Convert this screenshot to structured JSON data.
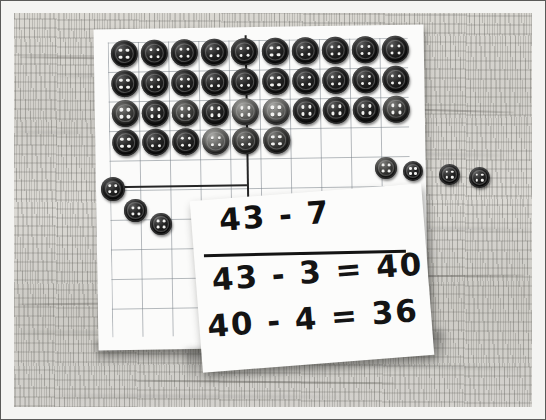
{
  "scene": {
    "title": "Place-value subtraction with buttons on graph paper",
    "medium": "photograph",
    "background": "wooden desk surface",
    "palette": {
      "desk": "#d4d2cc",
      "paper": "#fbfbfa",
      "card": "#fcfcfb",
      "ink": "#141414",
      "grid_line": "#78808833",
      "button_dark": "#0d0d0d",
      "button_hole": "#f2f2f0"
    }
  },
  "handwriting": {
    "problem": "43 - 7",
    "step_1": "43 - 3 = 40",
    "step_2": "40 - 4 = 36"
  },
  "chart_data": {
    "type": "table",
    "xlabel": "grid column",
    "ylabel": "grid row",
    "grid": true,
    "legend": "none",
    "rows": [
      {
        "row": 1,
        "tens_side": 5,
        "ones_side": 5,
        "total": 10
      },
      {
        "row": 2,
        "tens_side": 5,
        "ones_side": 5,
        "total": 10
      },
      {
        "row": 3,
        "tens_side": 5,
        "ones_side": 5,
        "total": 10
      },
      {
        "row": 4,
        "tens_side": 5,
        "ones_side": 1,
        "total": 6
      }
    ],
    "categories": [
      "row 1",
      "row 2",
      "row 3",
      "row 4"
    ],
    "values": [
      10,
      10,
      10,
      6
    ],
    "buttons_remaining_on_grid": 36,
    "buttons_removed_right": 4,
    "buttons_removed_bottom_left": 3,
    "buttons_removed_total": 7,
    "buttons_at_start": 43,
    "annotations": [
      "43 - 7",
      "43 - 3 = 40",
      "40 - 4 = 36"
    ]
  },
  "grid_buttons": [
    {
      "r": 0,
      "c": 0,
      "tone": "dark"
    },
    {
      "r": 0,
      "c": 1,
      "tone": "dark"
    },
    {
      "r": 0,
      "c": 2,
      "tone": "dark"
    },
    {
      "r": 0,
      "c": 3,
      "tone": "dark"
    },
    {
      "r": 0,
      "c": 4,
      "tone": "dark"
    },
    {
      "r": 0,
      "c": 5,
      "tone": "dark"
    },
    {
      "r": 0,
      "c": 6,
      "tone": "dark"
    },
    {
      "r": 0,
      "c": 7,
      "tone": "dark"
    },
    {
      "r": 0,
      "c": 8,
      "tone": "dark"
    },
    {
      "r": 0,
      "c": 9,
      "tone": "dark"
    },
    {
      "r": 1,
      "c": 0,
      "tone": "dark"
    },
    {
      "r": 1,
      "c": 1,
      "tone": "dark"
    },
    {
      "r": 1,
      "c": 2,
      "tone": "dark"
    },
    {
      "r": 1,
      "c": 3,
      "tone": "dark"
    },
    {
      "r": 1,
      "c": 4,
      "tone": "dark"
    },
    {
      "r": 1,
      "c": 5,
      "tone": "dark"
    },
    {
      "r": 1,
      "c": 6,
      "tone": "dark"
    },
    {
      "r": 1,
      "c": 7,
      "tone": "dark"
    },
    {
      "r": 1,
      "c": 8,
      "tone": "dark"
    },
    {
      "r": 1,
      "c": 9,
      "tone": "dark"
    },
    {
      "r": 2,
      "c": 0,
      "tone": "mid"
    },
    {
      "r": 2,
      "c": 1,
      "tone": "dark"
    },
    {
      "r": 2,
      "c": 2,
      "tone": "mid"
    },
    {
      "r": 2,
      "c": 3,
      "tone": "dark"
    },
    {
      "r": 2,
      "c": 4,
      "tone": "light"
    },
    {
      "r": 2,
      "c": 5,
      "tone": "light"
    },
    {
      "r": 2,
      "c": 6,
      "tone": "dark"
    },
    {
      "r": 2,
      "c": 7,
      "tone": "dark"
    },
    {
      "r": 2,
      "c": 8,
      "tone": "dark"
    },
    {
      "r": 2,
      "c": 9,
      "tone": "mid"
    },
    {
      "r": 3,
      "c": 0,
      "tone": "dark"
    },
    {
      "r": 3,
      "c": 1,
      "tone": "dark"
    },
    {
      "r": 3,
      "c": 2,
      "tone": "dark"
    },
    {
      "r": 3,
      "c": 3,
      "tone": "light"
    },
    {
      "r": 3,
      "c": 4,
      "tone": "mid"
    },
    {
      "r": 3,
      "c": 5,
      "tone": "mid"
    }
  ],
  "loose_buttons": [
    {
      "x": 375,
      "y": 157,
      "size": 22,
      "tone": "mid",
      "group": "right"
    },
    {
      "x": 403,
      "y": 161,
      "size": 20,
      "tone": "dark",
      "group": "right"
    },
    {
      "x": 439,
      "y": 164,
      "size": 21,
      "tone": "dark",
      "group": "right"
    },
    {
      "x": 469,
      "y": 167,
      "size": 21,
      "tone": "dark",
      "group": "right"
    },
    {
      "x": 101,
      "y": 177,
      "size": 24,
      "tone": "dark",
      "group": "bottom-left"
    },
    {
      "x": 124,
      "y": 199,
      "size": 23,
      "tone": "dark",
      "group": "bottom-left"
    },
    {
      "x": 150,
      "y": 213,
      "size": 22,
      "tone": "dark",
      "group": "bottom-left"
    }
  ],
  "wood_grain": [
    {
      "x": 6,
      "y": 44,
      "w": 120,
      "rot": 0.8,
      "soft": false
    },
    {
      "x": 40,
      "y": 62,
      "w": 90,
      "rot": 1.2,
      "soft": true
    },
    {
      "x": 0,
      "y": 118,
      "w": 70,
      "rot": 0.4,
      "soft": true
    },
    {
      "x": 4,
      "y": 290,
      "w": 100,
      "rot": -0.6,
      "soft": false
    },
    {
      "x": 2,
      "y": 318,
      "w": 140,
      "rot": 0.3,
      "soft": true
    },
    {
      "x": 330,
      "y": 96,
      "w": 170,
      "rot": 1.6,
      "soft": false
    },
    {
      "x": 372,
      "y": 140,
      "w": 120,
      "rot": 1.1,
      "soft": true
    },
    {
      "x": 340,
      "y": 214,
      "w": 180,
      "rot": 0.9,
      "soft": true
    },
    {
      "x": 360,
      "y": 262,
      "w": 150,
      "rot": -0.4,
      "soft": false
    },
    {
      "x": 300,
      "y": 352,
      "w": 210,
      "rot": 1.4,
      "soft": true
    },
    {
      "x": 120,
      "y": 368,
      "w": 260,
      "rot": 0.6,
      "soft": false
    },
    {
      "x": 30,
      "y": 382,
      "w": 300,
      "rot": 0.2,
      "soft": true
    }
  ]
}
